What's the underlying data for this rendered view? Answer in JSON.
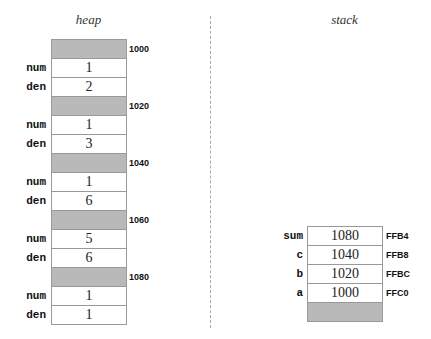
{
  "heap": {
    "title": "heap",
    "rows": [
      {
        "type": "header",
        "address": "1000"
      },
      {
        "type": "field",
        "label": "num",
        "value": "1"
      },
      {
        "type": "field",
        "label": "den",
        "value": "2"
      },
      {
        "type": "header",
        "address": "1020"
      },
      {
        "type": "field",
        "label": "num",
        "value": "1"
      },
      {
        "type": "field",
        "label": "den",
        "value": "3"
      },
      {
        "type": "header",
        "address": "1040"
      },
      {
        "type": "field",
        "label": "num",
        "value": "1"
      },
      {
        "type": "field",
        "label": "den",
        "value": "6"
      },
      {
        "type": "header",
        "address": "1060"
      },
      {
        "type": "field",
        "label": "num",
        "value": "5"
      },
      {
        "type": "field",
        "label": "den",
        "value": "6"
      },
      {
        "type": "header",
        "address": "1080"
      },
      {
        "type": "field",
        "label": "num",
        "value": "1"
      },
      {
        "type": "field",
        "label": "den",
        "value": "1"
      }
    ]
  },
  "stack": {
    "title": "stack",
    "rows": [
      {
        "label": "sum",
        "value": "1080",
        "address": "FFB4"
      },
      {
        "label": "c",
        "value": "1040",
        "address": "FFB8"
      },
      {
        "label": "b",
        "value": "1020",
        "address": "FFBC"
      },
      {
        "label": "a",
        "value": "1000",
        "address": "FFC0"
      },
      {
        "label": "",
        "value": "",
        "address": "",
        "gray": true
      }
    ]
  },
  "colors": {
    "cell_fill": "#b9b9b9",
    "border": "#999999"
  }
}
